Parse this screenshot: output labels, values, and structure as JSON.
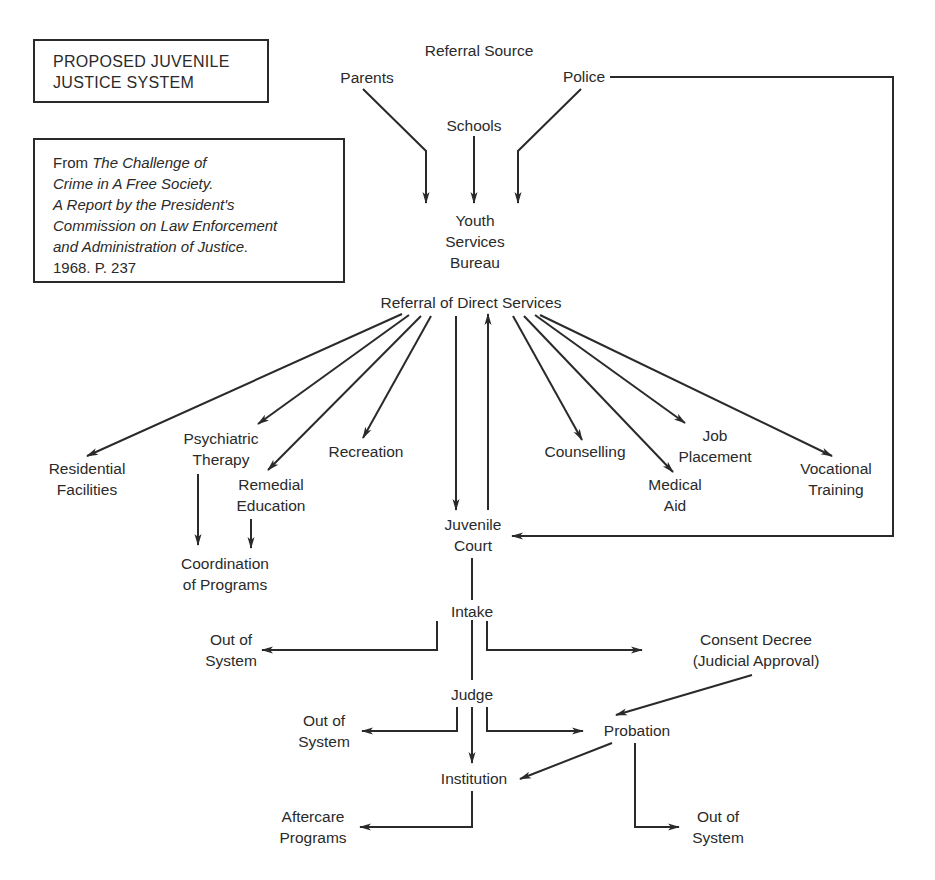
{
  "title_box": {
    "line1": "PROPOSED JUVENILE",
    "line2": "JUSTICE SYSTEM"
  },
  "citation_box": {
    "prefix": "From ",
    "italic_line1": "The Challenge of",
    "italic_line2": "Crime in A Free Society.",
    "italic_line3": "A Report by the President's",
    "italic_line4": "Commission on Law Enforcement",
    "italic_line5": "and Administration of Justice.",
    "line6": "1968.  P. 237"
  },
  "nodes": {
    "referral_source": "Referral Source",
    "parents": "Parents",
    "schools": "Schools",
    "police": "Police",
    "youth_services_bureau": [
      "Youth",
      "Services",
      "Bureau"
    ],
    "referral_direct_services": "Referral of Direct Services",
    "residential_facilities": [
      "Residential",
      "Facilities"
    ],
    "psychiatric_therapy": [
      "Psychiatric",
      "Therapy"
    ],
    "remedial_education": [
      "Remedial",
      "Education"
    ],
    "recreation": "Recreation",
    "coordination_programs": [
      "Coordination",
      "of Programs"
    ],
    "counselling": "Counselling",
    "medical_aid": [
      "Medical",
      "Aid"
    ],
    "job_placement": [
      "Job",
      "Placement"
    ],
    "vocational_training": [
      "Vocational",
      "Training"
    ],
    "juvenile_court": [
      "Juvenile",
      "Court"
    ],
    "intake": "Intake",
    "out_of_system_1": [
      "Out of",
      "System"
    ],
    "consent_decree": [
      "Consent Decree",
      "(Judicial Approval)"
    ],
    "judge": "Judge",
    "out_of_system_2": [
      "Out of",
      "System"
    ],
    "probation": "Probation",
    "institution": "Institution",
    "aftercare_programs": [
      "Aftercare",
      "Programs"
    ],
    "out_of_system_3": [
      "Out of",
      "System"
    ]
  },
  "edges": [
    [
      "Parents",
      "Youth Services Bureau"
    ],
    [
      "Schools",
      "Youth Services Bureau"
    ],
    [
      "Police",
      "Youth Services Bureau"
    ],
    [
      "Police",
      "Juvenile Court"
    ],
    [
      "Referral of Direct Services",
      "Residential Facilities"
    ],
    [
      "Referral of Direct Services",
      "Psychiatric Therapy"
    ],
    [
      "Referral of Direct Services",
      "Remedial Education"
    ],
    [
      "Referral of Direct Services",
      "Recreation"
    ],
    [
      "Referral of Direct Services",
      "Juvenile Court"
    ],
    [
      "Juvenile Court",
      "Referral of Direct Services"
    ],
    [
      "Referral of Direct Services",
      "Counselling"
    ],
    [
      "Referral of Direct Services",
      "Medical Aid"
    ],
    [
      "Referral of Direct Services",
      "Job Placement"
    ],
    [
      "Referral of Direct Services",
      "Vocational Training"
    ],
    [
      "Psychiatric Therapy",
      "Coordination of Programs"
    ],
    [
      "Remedial Education",
      "Coordination of Programs"
    ],
    [
      "Juvenile Court",
      "Intake"
    ],
    [
      "Intake",
      "Out of System"
    ],
    [
      "Intake",
      "Consent Decree (Judicial Approval)"
    ],
    [
      "Intake",
      "Judge"
    ],
    [
      "Consent Decree (Judicial Approval)",
      "Probation"
    ],
    [
      "Judge",
      "Out of System"
    ],
    [
      "Judge",
      "Probation"
    ],
    [
      "Judge",
      "Institution"
    ],
    [
      "Probation",
      "Institution"
    ],
    [
      "Probation",
      "Out of System"
    ],
    [
      "Institution",
      "Aftercare Programs"
    ]
  ],
  "colors": {
    "ink": "#2a2a2a",
    "background": "#ffffff"
  }
}
